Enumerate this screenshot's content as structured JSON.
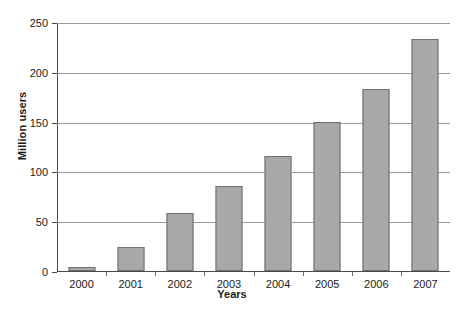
{
  "chart_data": {
    "type": "bar",
    "title": "",
    "xlabel": "Years",
    "ylabel": "Million users",
    "categories": [
      "2000",
      "2001",
      "2002",
      "2003",
      "2004",
      "2005",
      "2006",
      "2007"
    ],
    "values": [
      4,
      24,
      58,
      85,
      115,
      150,
      183,
      233
    ],
    "ylim": [
      0,
      250
    ],
    "yticks": [
      0,
      50,
      100,
      150,
      200,
      250
    ],
    "ytick_labels": [
      "0",
      "50",
      "100",
      "150",
      "200",
      "250"
    ],
    "grid": "horizontal",
    "legend": "none",
    "bar_color": "#a8a8a8",
    "bar_edge_color": "#6f6f6f",
    "grid_color": "#9a9a9a",
    "axis_color": "#4a4a4a",
    "background": "#ffffff"
  },
  "caption_remnant": "·  ···  ·· ··  ·· ·  ···· ·  ··        ·· ·   · ··"
}
